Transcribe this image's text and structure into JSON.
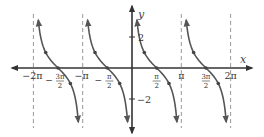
{
  "chart_data": {
    "type": "line",
    "title": "",
    "function": "y = cot(x)",
    "xlabel": "x",
    "ylabel": "y",
    "xlim_pi": [
      -2.3,
      2.5
    ],
    "ylim": [
      -4.2,
      4.4
    ],
    "grid": false,
    "asymptotes_pi": [
      -2,
      -1,
      1,
      2
    ],
    "x_ticks": [
      {
        "value_pi": -2,
        "label": "−2π",
        "type": "whole"
      },
      {
        "value_pi": -1.5,
        "num": "3π",
        "den": "2",
        "sign": "−",
        "type": "frac"
      },
      {
        "value_pi": -1,
        "label": "−π",
        "type": "whole"
      },
      {
        "value_pi": -0.5,
        "num": "π",
        "den": "2",
        "sign": "−",
        "type": "frac"
      },
      {
        "value_pi": 0.5,
        "num": "π",
        "den": "2",
        "sign": "",
        "type": "frac"
      },
      {
        "value_pi": 1,
        "label": "π",
        "type": "whole"
      },
      {
        "value_pi": 1.5,
        "num": "3π",
        "den": "2",
        "sign": "",
        "type": "frac"
      },
      {
        "value_pi": 2,
        "label": "2π",
        "type": "whole"
      }
    ],
    "y_ticks": [
      {
        "value": 2,
        "label": "2"
      },
      {
        "value": -2,
        "label": "−2"
      }
    ],
    "branches_pi": [
      [
        -2,
        -1
      ],
      [
        -1,
        0
      ],
      [
        0,
        1
      ],
      [
        1,
        2
      ]
    ],
    "marked_points": [
      {
        "x_pi": -1.75,
        "y": 1
      },
      {
        "x_pi": -1.5,
        "y": 0
      },
      {
        "x_pi": -1.25,
        "y": -1
      },
      {
        "x_pi": -0.75,
        "y": 1
      },
      {
        "x_pi": -0.5,
        "y": 0
      },
      {
        "x_pi": -0.25,
        "y": -1
      },
      {
        "x_pi": 0.25,
        "y": 1
      },
      {
        "x_pi": 0.5,
        "y": 0
      },
      {
        "x_pi": 0.75,
        "y": -1
      },
      {
        "x_pi": 1.25,
        "y": 1
      },
      {
        "x_pi": 1.5,
        "y": 0
      },
      {
        "x_pi": 1.75,
        "y": -1
      }
    ],
    "colors": {
      "curve": "#555555",
      "axis": "#333333",
      "asymptote": "#999999",
      "point": "#444444"
    }
  }
}
